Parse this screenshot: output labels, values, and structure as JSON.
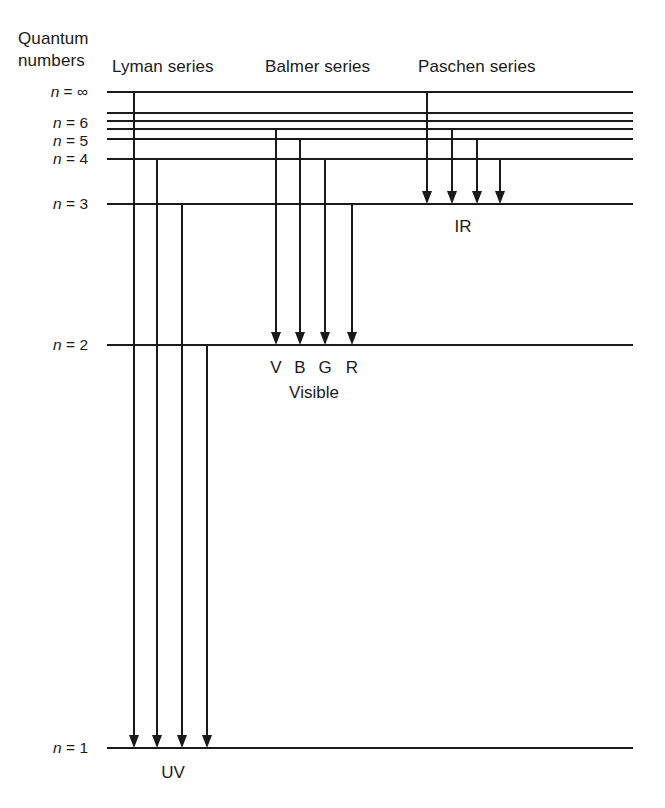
{
  "figure": {
    "axis_caption_lines": [
      "Quantum",
      "numbers"
    ],
    "background_color": "#ffffff",
    "ink_color": "#1a1a1a"
  },
  "series_headers": [
    {
      "id": "lyman",
      "label": "Lyman series",
      "x": 112,
      "y": 72
    },
    {
      "id": "balmer",
      "label": "Balmer series",
      "x": 265,
      "y": 72
    },
    {
      "id": "paschen",
      "label": "Paschen series",
      "x": 418,
      "y": 72
    }
  ],
  "quantum_label": {
    "line1": "Quantum",
    "line2": "numbers",
    "line1_x": 18,
    "line1_y": 44,
    "line2_x": 18,
    "line2_y": 66
  },
  "levels": [
    {
      "id": "n-inf",
      "n": "∞",
      "label_prefix": "n",
      "label_eq": "=",
      "label_value": "∞",
      "full_label": "n = ∞",
      "y": 92,
      "x_start": 107,
      "x_end": 633,
      "labeled": true,
      "label_x": 88,
      "label_y": 97
    },
    {
      "id": "n-8",
      "n": "8",
      "label_prefix": "n",
      "label_eq": "=",
      "label_value": "8",
      "full_label": "",
      "y": 113,
      "x_start": 107,
      "x_end": 633,
      "labeled": false
    },
    {
      "id": "n-7",
      "n": "7",
      "label_prefix": "n",
      "label_eq": "=",
      "label_value": "7",
      "full_label": "",
      "y": 121,
      "x_start": 107,
      "x_end": 633,
      "labeled": false
    },
    {
      "id": "n-6",
      "n": "6",
      "label_prefix": "n",
      "label_eq": "=",
      "label_value": "6",
      "full_label": "n = 6",
      "y": 129,
      "x_start": 107,
      "x_end": 633,
      "labeled": true,
      "label_x": 88,
      "label_y": 128
    },
    {
      "id": "n-5",
      "n": "5",
      "label_prefix": "n",
      "label_eq": "=",
      "label_value": "5",
      "full_label": "n = 5",
      "y": 139,
      "x_start": 107,
      "x_end": 633,
      "labeled": true,
      "label_x": 88,
      "label_y": 146
    },
    {
      "id": "n-4",
      "n": "4",
      "label_prefix": "n",
      "label_eq": "=",
      "label_value": "4",
      "full_label": "n = 4",
      "y": 159,
      "x_start": 107,
      "x_end": 633,
      "labeled": true,
      "label_x": 88,
      "label_y": 164
    },
    {
      "id": "n-3",
      "n": "3",
      "label_prefix": "n",
      "label_eq": "=",
      "label_value": "3",
      "full_label": "n = 3",
      "y": 204,
      "x_start": 107,
      "x_end": 633,
      "labeled": true,
      "label_x": 88,
      "label_y": 209
    },
    {
      "id": "n-2",
      "n": "2",
      "label_prefix": "n",
      "label_eq": "=",
      "label_value": "2",
      "full_label": "n = 2",
      "y": 345,
      "x_start": 107,
      "x_end": 633,
      "labeled": true,
      "label_x": 88,
      "label_y": 350
    },
    {
      "id": "n-1",
      "n": "1",
      "label_prefix": "n",
      "label_eq": "=",
      "label_value": "1",
      "full_label": "n = 1",
      "y": 748,
      "x_start": 107,
      "x_end": 633,
      "labeled": true,
      "label_x": 88,
      "label_y": 753
    }
  ],
  "transitions": [
    {
      "id": "lyman-1",
      "series": "lyman",
      "from_level": "n-inf",
      "to_level": "n-1",
      "x": 134,
      "y_from": 92,
      "y_to": 748,
      "color_label": ""
    },
    {
      "id": "lyman-2",
      "series": "lyman",
      "from_level": "n-4",
      "to_level": "n-1",
      "x": 157,
      "y_from": 159,
      "y_to": 748,
      "color_label": ""
    },
    {
      "id": "lyman-3",
      "series": "lyman",
      "from_level": "n-3",
      "to_level": "n-1",
      "x": 182,
      "y_from": 204,
      "y_to": 748,
      "color_label": ""
    },
    {
      "id": "lyman-4",
      "series": "lyman",
      "from_level": "n-2",
      "to_level": "n-1",
      "x": 207,
      "y_from": 345,
      "y_to": 748,
      "color_label": ""
    },
    {
      "id": "balmer-1",
      "series": "balmer",
      "from_level": "n-6",
      "to_level": "n-2",
      "x": 276,
      "y_from": 129,
      "y_to": 345,
      "color_label": "V"
    },
    {
      "id": "balmer-2",
      "series": "balmer",
      "from_level": "n-5",
      "to_level": "n-2",
      "x": 300,
      "y_from": 139,
      "y_to": 345,
      "color_label": "B"
    },
    {
      "id": "balmer-3",
      "series": "balmer",
      "from_level": "n-4",
      "to_level": "n-2",
      "x": 325,
      "y_from": 159,
      "y_to": 345,
      "color_label": "G"
    },
    {
      "id": "balmer-4",
      "series": "balmer",
      "from_level": "n-3",
      "to_level": "n-2",
      "x": 352,
      "y_from": 204,
      "y_to": 345,
      "color_label": "R"
    },
    {
      "id": "paschen-1",
      "series": "paschen",
      "from_level": "n-inf",
      "to_level": "n-3",
      "x": 427,
      "y_from": 92,
      "y_to": 204,
      "color_label": ""
    },
    {
      "id": "paschen-2",
      "series": "paschen",
      "from_level": "n-6",
      "to_level": "n-3",
      "x": 452,
      "y_from": 129,
      "y_to": 204,
      "color_label": ""
    },
    {
      "id": "paschen-3",
      "series": "paschen",
      "from_level": "n-5",
      "to_level": "n-3",
      "x": 477,
      "y_from": 139,
      "y_to": 204,
      "color_label": ""
    },
    {
      "id": "paschen-4",
      "series": "paschen",
      "from_level": "n-4",
      "to_level": "n-3",
      "x": 500,
      "y_from": 159,
      "y_to": 204,
      "color_label": ""
    }
  ],
  "color_labels": [
    {
      "id": "violet",
      "text": "V",
      "x": 276,
      "y": 373
    },
    {
      "id": "blue",
      "text": "B",
      "x": 300,
      "y": 373
    },
    {
      "id": "green",
      "text": "G",
      "x": 325,
      "y": 373
    },
    {
      "id": "red",
      "text": "R",
      "x": 352,
      "y": 373
    }
  ],
  "band_labels": [
    {
      "id": "ir",
      "text": "IR",
      "x": 463,
      "y": 232
    },
    {
      "id": "visible",
      "text": "Visible",
      "x": 314,
      "y": 398
    },
    {
      "id": "uv",
      "text": "UV",
      "x": 173,
      "y": 778
    }
  ]
}
